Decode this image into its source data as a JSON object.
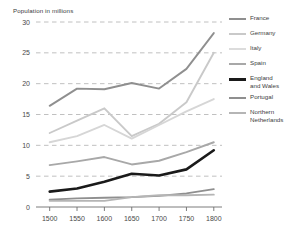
{
  "chart_data": {
    "type": "line",
    "title": "Population in millions",
    "xlabel": "",
    "ylabel": "Population in millions",
    "xlim": [
      1475,
      1815
    ],
    "ylim": [
      0,
      30
    ],
    "grid": true,
    "legend_position": "right",
    "x": [
      1500,
      1550,
      1600,
      1650,
      1700,
      1750,
      1800
    ],
    "categories": [
      "1500",
      "1550",
      "1600",
      "1650",
      "1700",
      "1750",
      "1800"
    ],
    "yticks": [
      0,
      5,
      10,
      15,
      20,
      25,
      30
    ],
    "ytick_labels": [
      "0",
      "5",
      "10",
      "15",
      "20",
      "25",
      "30"
    ],
    "series": [
      {
        "name": "France",
        "color": "#8f8f8f",
        "width": 1.9,
        "values": [
          16.4,
          19.2,
          19.1,
          20.1,
          19.2,
          22.4,
          28.2
        ]
      },
      {
        "name": "Germany",
        "color": "#c9c9c9",
        "width": 1.9,
        "values": [
          12.0,
          14.0,
          16.0,
          11.5,
          13.5,
          17.0,
          25.0
        ]
      },
      {
        "name": "Italy",
        "color": "#d6d6d6",
        "width": 1.9,
        "values": [
          10.5,
          11.5,
          13.3,
          11.1,
          13.3,
          15.5,
          17.5
        ]
      },
      {
        "name": "Spain",
        "color": "#a8a8a8",
        "width": 1.9,
        "values": [
          6.8,
          7.4,
          8.1,
          6.9,
          7.5,
          8.9,
          10.5
        ]
      },
      {
        "name": "England\nand Wales",
        "color": "#1a1a1a",
        "width": 2.6,
        "values": [
          2.5,
          3.0,
          4.1,
          5.4,
          5.1,
          6.1,
          9.2
        ]
      },
      {
        "name": "Portugal",
        "color": "#8f8f8f",
        "width": 1.9,
        "values": [
          1.2,
          1.4,
          1.5,
          1.6,
          1.8,
          2.2,
          2.9
        ]
      },
      {
        "name": "Northern\nNetherlands",
        "color": "#b5b5b5",
        "width": 1.9,
        "values": [
          1.0,
          1.0,
          1.0,
          1.6,
          1.9,
          1.9,
          2.0
        ]
      }
    ]
  },
  "legend": {
    "items": [
      {
        "label": "France",
        "color": "#8f8f8f",
        "bold": false
      },
      {
        "label": "Germany",
        "color": "#c9c9c9",
        "bold": false
      },
      {
        "label": "Italy",
        "color": "#dcdcdc",
        "bold": false
      },
      {
        "label": "Spain",
        "color": "#a8a8a8",
        "bold": false
      },
      {
        "label": "England\nand Wales",
        "color": "#1a1a1a",
        "bold": true
      },
      {
        "label": "Portugal",
        "color": "#8f8f8f",
        "bold": false
      },
      {
        "label": "Northern\nNetherlands",
        "color": "#b5b5b5",
        "bold": false
      }
    ]
  },
  "axes": {
    "gridline_color": "#b9b9b9",
    "axis_color": "#6e6e6e",
    "tick_text_color": "#4a4a4a"
  }
}
